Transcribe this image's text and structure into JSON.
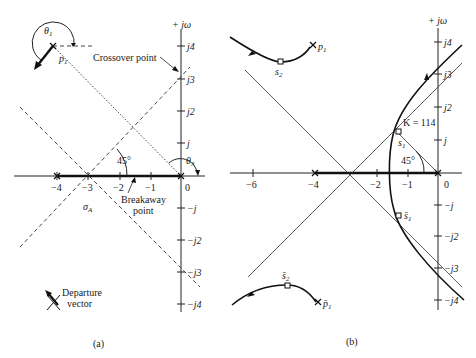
{
  "panel_a": {
    "caption": "(a)",
    "imag_axis_label": "+ jω",
    "real_ticks": [
      "−4",
      "−3",
      "−2",
      "−1",
      "0"
    ],
    "imag_ticks_pos": [
      "j",
      "j2",
      "j3",
      "j4"
    ],
    "imag_ticks_neg": [
      "−j",
      "−j2",
      "−j3",
      "−j4"
    ],
    "pole_label": "p",
    "pole_sub": "1",
    "theta1": "θ",
    "theta1_sub": "1",
    "theta3": "θ",
    "theta3_sub": "3",
    "angle_label": "45°",
    "sigma_label": "σ",
    "sigma_sub": "A",
    "crossover_label": "Crossover point",
    "breakaway_line1": "Breakaway",
    "breakaway_line2": "point",
    "departure_line1": "Departure",
    "departure_line2": "vector"
  },
  "panel_b": {
    "caption": "(b)",
    "imag_axis_label": "+ jω",
    "real_ticks": [
      "−6",
      "−4",
      "−2",
      "−1",
      "0"
    ],
    "imag_ticks_pos": [
      "j",
      "j2",
      "j3",
      "j4"
    ],
    "imag_ticks_neg": [
      "−j",
      "−j2",
      "−j3",
      "−j4"
    ],
    "gain_label": "K = 114",
    "angle_label": "45°",
    "p1_label": "p",
    "p1_sub": "1",
    "p1bar_label": "p̄",
    "p1bar_sub": "1",
    "s1_label": "s",
    "s1_sub": "1",
    "s1bar_label": "s̄",
    "s1bar_sub": "1",
    "s2_label": "s",
    "s2_sub": "2",
    "s2bar_label": "s̄",
    "s2bar_sub": "2"
  }
}
